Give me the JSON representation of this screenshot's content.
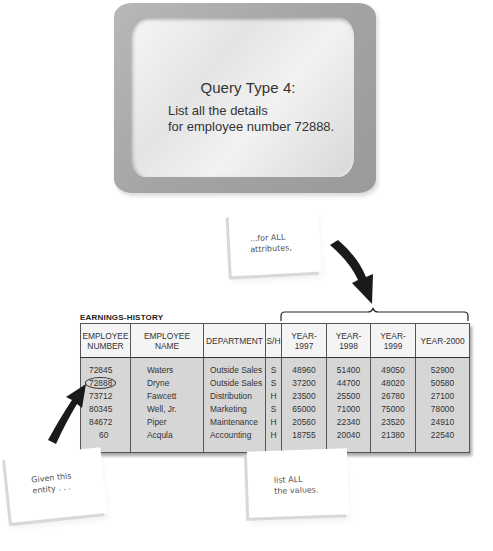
{
  "monitor": {
    "title": "Query Type 4:",
    "body_lines": [
      "List all the details",
      "for employee number 72888."
    ]
  },
  "notes": {
    "top": [
      "...for ALL",
      "attributes,"
    ],
    "left": [
      "Given this",
      "entity . . ."
    ],
    "bottom": [
      "list ALL",
      "the values."
    ]
  },
  "table": {
    "caption": "EARNINGS-HISTORY",
    "headers": [
      "EMPLOYEE NUMBER",
      "EMPLOYEE NAME",
      "DEPARTMENT",
      "S/H",
      "YEAR-1997",
      "YEAR-1998",
      "YEAR-1999",
      "YEAR-2000"
    ],
    "header_lines": {
      "emp_num_1": "EMPLOYEE",
      "emp_num_2": "NUMBER"
    },
    "highlighted_row": 1,
    "rows": [
      {
        "emp_no": "72845",
        "name": "Waters",
        "dept": "Outside Sales",
        "sh": "S",
        "y1997": "48960",
        "y1998": "51400",
        "y1999": "49050",
        "y2000": "52900"
      },
      {
        "emp_no": "72888",
        "name": "Dryne",
        "dept": "Outside Sales",
        "sh": "S",
        "y1997": "37200",
        "y1998": "44700",
        "y1999": "48020",
        "y2000": "50580"
      },
      {
        "emp_no": "73712",
        "name": "Fawcett",
        "dept": "Distribution",
        "sh": "H",
        "y1997": "23500",
        "y1998": "25500",
        "y1999": "26780",
        "y2000": "27100"
      },
      {
        "emp_no": "80345",
        "name": "Well, Jr.",
        "dept": "Marketing",
        "sh": "S",
        "y1997": "65000",
        "y1998": "71000",
        "y1999": "75000",
        "y2000": "78000"
      },
      {
        "emp_no": "84672",
        "name": "Piper",
        "dept": "Maintenance",
        "sh": "H",
        "y1997": "20560",
        "y1998": "22340",
        "y1999": "23520",
        "y2000": "24910"
      },
      {
        "emp_no": "60",
        "name": "Acqula",
        "dept": "Accounting",
        "sh": "H",
        "y1997": "18755",
        "y1998": "20040",
        "y1999": "21380",
        "y2000": "22540"
      }
    ]
  },
  "colors": {
    "monitor_bezel": "#a8a8a8",
    "screen": "#ececec",
    "table_body": "#d6d6d6",
    "table_header": "#f4f4f4",
    "arrow": "#1a1a1a"
  }
}
